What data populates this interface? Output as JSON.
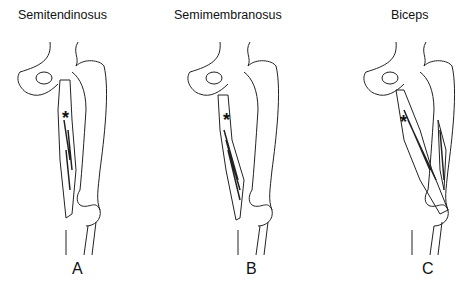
{
  "panels": [
    {
      "title": "Semitendinosus",
      "letter": "A",
      "marker": "*"
    },
    {
      "title": "Semimembranosus",
      "letter": "B",
      "marker": "*"
    },
    {
      "title": "Biceps",
      "letter": "C",
      "marker": "*"
    }
  ]
}
